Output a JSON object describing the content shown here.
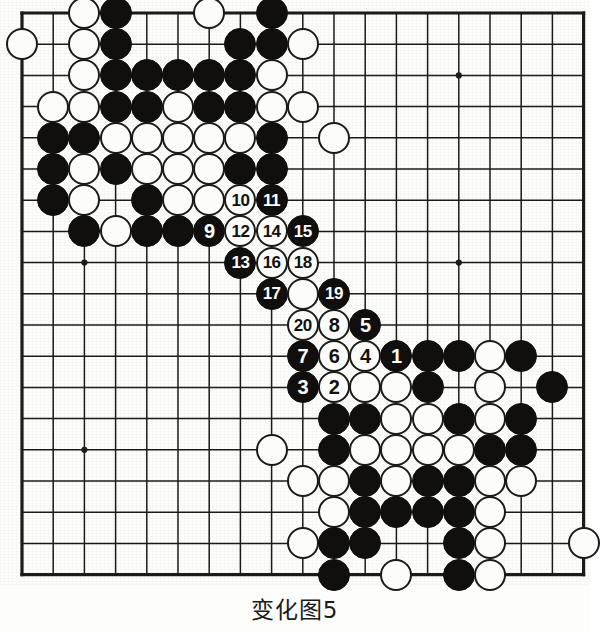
{
  "diagram": {
    "caption": "变化图5",
    "board_size": 19,
    "geometry": {
      "left": 22,
      "top": 13,
      "spacing": 31.2,
      "stone_radius": 16,
      "star_points": [
        [
          3,
          3
        ],
        [
          3,
          9
        ],
        [
          3,
          15
        ],
        [
          9,
          3
        ],
        [
          9,
          9
        ],
        [
          9,
          15
        ],
        [
          15,
          3
        ],
        [
          15,
          9
        ],
        [
          15,
          15
        ]
      ]
    },
    "colors": {
      "black": "#100f0d",
      "white": "#fcfcfa",
      "line": "#1b1b1b",
      "board": "#fdfdfb",
      "black_number": "#ffffff",
      "white_number": "#111111"
    },
    "plain_stones": [
      {
        "c": "W",
        "x": 3,
        "y": 1
      },
      {
        "c": "B",
        "x": 4,
        "y": 1
      },
      {
        "c": "W",
        "x": 7,
        "y": 1
      },
      {
        "c": "B",
        "x": 9,
        "y": 1
      },
      {
        "c": "W",
        "x": 1,
        "y": 2
      },
      {
        "c": "W",
        "x": 3,
        "y": 2
      },
      {
        "c": "B",
        "x": 4,
        "y": 2
      },
      {
        "c": "B",
        "x": 8,
        "y": 2
      },
      {
        "c": "B",
        "x": 9,
        "y": 2
      },
      {
        "c": "W",
        "x": 10,
        "y": 2
      },
      {
        "c": "W",
        "x": 3,
        "y": 3
      },
      {
        "c": "B",
        "x": 4,
        "y": 3
      },
      {
        "c": "B",
        "x": 5,
        "y": 3
      },
      {
        "c": "B",
        "x": 6,
        "y": 3
      },
      {
        "c": "B",
        "x": 7,
        "y": 3
      },
      {
        "c": "B",
        "x": 8,
        "y": 3
      },
      {
        "c": "W",
        "x": 9,
        "y": 3
      },
      {
        "c": "W",
        "x": 2,
        "y": 4
      },
      {
        "c": "W",
        "x": 3,
        "y": 4
      },
      {
        "c": "B",
        "x": 4,
        "y": 4
      },
      {
        "c": "B",
        "x": 5,
        "y": 4
      },
      {
        "c": "W",
        "x": 6,
        "y": 4
      },
      {
        "c": "B",
        "x": 7,
        "y": 4
      },
      {
        "c": "B",
        "x": 8,
        "y": 4
      },
      {
        "c": "W",
        "x": 9,
        "y": 4
      },
      {
        "c": "W",
        "x": 10,
        "y": 4
      },
      {
        "c": "B",
        "x": 2,
        "y": 5
      },
      {
        "c": "B",
        "x": 3,
        "y": 5
      },
      {
        "c": "W",
        "x": 4,
        "y": 5
      },
      {
        "c": "W",
        "x": 5,
        "y": 5
      },
      {
        "c": "W",
        "x": 6,
        "y": 5
      },
      {
        "c": "W",
        "x": 7,
        "y": 5
      },
      {
        "c": "W",
        "x": 8,
        "y": 5
      },
      {
        "c": "B",
        "x": 9,
        "y": 5
      },
      {
        "c": "W",
        "x": 11,
        "y": 5
      },
      {
        "c": "B",
        "x": 2,
        "y": 6
      },
      {
        "c": "W",
        "x": 3,
        "y": 6
      },
      {
        "c": "B",
        "x": 4,
        "y": 6
      },
      {
        "c": "W",
        "x": 5,
        "y": 6
      },
      {
        "c": "W",
        "x": 6,
        "y": 6
      },
      {
        "c": "W",
        "x": 7,
        "y": 6
      },
      {
        "c": "B",
        "x": 8,
        "y": 6
      },
      {
        "c": "B",
        "x": 9,
        "y": 6
      },
      {
        "c": "B",
        "x": 2,
        "y": 7
      },
      {
        "c": "W",
        "x": 3,
        "y": 7
      },
      {
        "c": "B",
        "x": 5,
        "y": 7
      },
      {
        "c": "W",
        "x": 6,
        "y": 7
      },
      {
        "c": "W",
        "x": 7,
        "y": 7
      },
      {
        "c": "W",
        "x": 8,
        "y": 7
      },
      {
        "c": "B",
        "x": 3,
        "y": 8
      },
      {
        "c": "W",
        "x": 4,
        "y": 8
      },
      {
        "c": "B",
        "x": 5,
        "y": 8
      },
      {
        "c": "B",
        "x": 6,
        "y": 8
      },
      {
        "c": "W",
        "x": 10,
        "y": 10
      },
      {
        "c": "B",
        "x": 13,
        "y": 12
      },
      {
        "c": "B",
        "x": 14,
        "y": 12
      },
      {
        "c": "B",
        "x": 15,
        "y": 12
      },
      {
        "c": "W",
        "x": 16,
        "y": 12
      },
      {
        "c": "B",
        "x": 17,
        "y": 12
      },
      {
        "c": "W",
        "x": 12,
        "y": 13
      },
      {
        "c": "W",
        "x": 13,
        "y": 13
      },
      {
        "c": "B",
        "x": 14,
        "y": 13
      },
      {
        "c": "W",
        "x": 16,
        "y": 13
      },
      {
        "c": "B",
        "x": 18,
        "y": 13
      },
      {
        "c": "B",
        "x": 11,
        "y": 14
      },
      {
        "c": "B",
        "x": 12,
        "y": 14
      },
      {
        "c": "W",
        "x": 13,
        "y": 14
      },
      {
        "c": "W",
        "x": 14,
        "y": 14
      },
      {
        "c": "B",
        "x": 15,
        "y": 14
      },
      {
        "c": "W",
        "x": 16,
        "y": 14
      },
      {
        "c": "B",
        "x": 17,
        "y": 14
      },
      {
        "c": "W",
        "x": 9,
        "y": 15
      },
      {
        "c": "B",
        "x": 11,
        "y": 15
      },
      {
        "c": "W",
        "x": 12,
        "y": 15
      },
      {
        "c": "W",
        "x": 13,
        "y": 15
      },
      {
        "c": "W",
        "x": 14,
        "y": 15
      },
      {
        "c": "W",
        "x": 15,
        "y": 15
      },
      {
        "c": "B",
        "x": 16,
        "y": 15
      },
      {
        "c": "B",
        "x": 17,
        "y": 15
      },
      {
        "c": "W",
        "x": 10,
        "y": 16
      },
      {
        "c": "W",
        "x": 11,
        "y": 16
      },
      {
        "c": "B",
        "x": 12,
        "y": 16
      },
      {
        "c": "W",
        "x": 13,
        "y": 16
      },
      {
        "c": "B",
        "x": 14,
        "y": 16
      },
      {
        "c": "B",
        "x": 15,
        "y": 16
      },
      {
        "c": "W",
        "x": 16,
        "y": 16
      },
      {
        "c": "W",
        "x": 17,
        "y": 16
      },
      {
        "c": "W",
        "x": 11,
        "y": 17
      },
      {
        "c": "B",
        "x": 12,
        "y": 17
      },
      {
        "c": "B",
        "x": 13,
        "y": 17
      },
      {
        "c": "B",
        "x": 14,
        "y": 17
      },
      {
        "c": "B",
        "x": 15,
        "y": 17
      },
      {
        "c": "W",
        "x": 16,
        "y": 17
      },
      {
        "c": "W",
        "x": 10,
        "y": 18
      },
      {
        "c": "B",
        "x": 11,
        "y": 18
      },
      {
        "c": "B",
        "x": 12,
        "y": 18
      },
      {
        "c": "B",
        "x": 15,
        "y": 18
      },
      {
        "c": "W",
        "x": 16,
        "y": 18
      },
      {
        "c": "W",
        "x": 19,
        "y": 18
      },
      {
        "c": "B",
        "x": 11,
        "y": 19
      },
      {
        "c": "W",
        "x": 13,
        "y": 19
      },
      {
        "c": "B",
        "x": 15,
        "y": 19
      },
      {
        "c": "W",
        "x": 16,
        "y": 19
      }
    ],
    "numbered_stones": [
      {
        "n": "1",
        "c": "B",
        "x": 13,
        "y": 12
      },
      {
        "n": "2",
        "c": "W",
        "x": 11,
        "y": 13
      },
      {
        "n": "3",
        "c": "B",
        "x": 10,
        "y": 13
      },
      {
        "n": "4",
        "c": "W",
        "x": 12,
        "y": 12
      },
      {
        "n": "5",
        "c": "B",
        "x": 12,
        "y": 11
      },
      {
        "n": "6",
        "c": "W",
        "x": 11,
        "y": 12
      },
      {
        "n": "7",
        "c": "B",
        "x": 10,
        "y": 12
      },
      {
        "n": "8",
        "c": "W",
        "x": 11,
        "y": 11
      },
      {
        "n": "9",
        "c": "B",
        "x": 7,
        "y": 8
      },
      {
        "n": "10",
        "c": "W",
        "x": 8,
        "y": 7
      },
      {
        "n": "11",
        "c": "B",
        "x": 9,
        "y": 7
      },
      {
        "n": "12",
        "c": "W",
        "x": 8,
        "y": 8
      },
      {
        "n": "13",
        "c": "B",
        "x": 8,
        "y": 9
      },
      {
        "n": "14",
        "c": "W",
        "x": 9,
        "y": 8
      },
      {
        "n": "15",
        "c": "B",
        "x": 10,
        "y": 8
      },
      {
        "n": "16",
        "c": "W",
        "x": 9,
        "y": 9
      },
      {
        "n": "17",
        "c": "B",
        "x": 9,
        "y": 10
      },
      {
        "n": "18",
        "c": "W",
        "x": 10,
        "y": 9
      },
      {
        "n": "19",
        "c": "B",
        "x": 11,
        "y": 10
      },
      {
        "n": "20",
        "c": "W",
        "x": 10,
        "y": 11
      }
    ]
  }
}
